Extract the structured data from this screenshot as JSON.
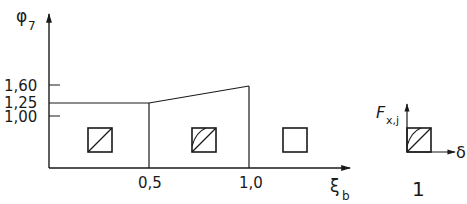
{
  "diagram": {
    "type": "step-function-diagram",
    "y_axis": {
      "symbol": "φ",
      "subscript": "7"
    },
    "x_axis": {
      "symbol": "ξ",
      "subscript": "b"
    },
    "y_ticks": [
      {
        "label": "1,60",
        "value": 1.6
      },
      {
        "label": "1,25",
        "value": 1.25
      },
      {
        "label": "1,00",
        "value": 1.0
      }
    ],
    "x_ticks": [
      {
        "label": "0,5",
        "value": 0.5
      },
      {
        "label": "1,0",
        "value": 1.0
      }
    ],
    "curve": {
      "description": "phi7 = 1.25 for xi_b in [0, 0.5], rising linearly to 1.60 at xi_b = 1.0",
      "points": [
        [
          0,
          1.25
        ],
        [
          0.5,
          1.25
        ],
        [
          1.0,
          1.6
        ]
      ]
    },
    "regions": [
      {
        "name": "region-1",
        "range": "0 to 0,5",
        "symbol": "square-single-diagonal"
      },
      {
        "name": "region-2",
        "range": "0,5 to 1,0",
        "symbol": "square-diagonal-with-arc"
      },
      {
        "name": "region-3",
        "range": "beyond 1,0",
        "symbol": "square-empty"
      }
    ],
    "legend": {
      "y_label": {
        "symbol": "F",
        "subscript": "x,j"
      },
      "x_label": "δ",
      "symbol": "square-diagonal-with-arc",
      "caption": "1"
    },
    "colors": {
      "line": "#1a1a1a",
      "background": "#ffffff"
    }
  }
}
